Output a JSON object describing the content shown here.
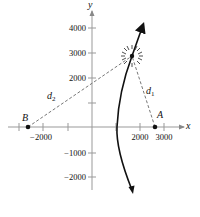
{
  "figure": {
    "type": "coordinate-diagram",
    "axes": {
      "x_label": "x",
      "y_label": "y",
      "x_ticks": [
        {
          "value": -3000,
          "label": ""
        },
        {
          "value": -2000,
          "label": "−2000"
        },
        {
          "value": -1000,
          "label": ""
        },
        {
          "value": 1000,
          "label": ""
        },
        {
          "value": 2000,
          "label": "2000"
        },
        {
          "value": 3000,
          "label": "3000"
        }
      ],
      "y_ticks": [
        {
          "value": 4000,
          "label": "4000"
        },
        {
          "value": 3000,
          "label": "3000"
        },
        {
          "value": 2000,
          "label": "2000"
        },
        {
          "value": 1000,
          "label": ""
        },
        {
          "value": -1000,
          "label": "−1000"
        },
        {
          "value": -2000,
          "label": "−2000"
        }
      ]
    },
    "points": [
      {
        "name": "A",
        "label": "A",
        "x": 2600,
        "y": 0
      },
      {
        "name": "B",
        "label": "B",
        "x": -2600,
        "y": 0
      },
      {
        "name": "object",
        "label": "",
        "x": 1650,
        "y": 2850,
        "marker": "starburst"
      }
    ],
    "segments": [
      {
        "name": "d1",
        "label_main": "d",
        "label_sub": "1",
        "from": "object",
        "to": "A",
        "style": "dashed"
      },
      {
        "name": "d2",
        "label_main": "d",
        "label_sub": "2",
        "from": "object",
        "to": "B",
        "style": "dashed"
      }
    ],
    "curve": {
      "description": "hyperbola branch with arrows at both ends",
      "style": "solid-bold"
    }
  }
}
